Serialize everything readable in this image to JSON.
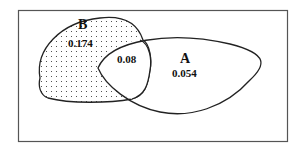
{
  "diagram": {
    "type": "venn",
    "sets": [
      {
        "id": "B",
        "label": "B",
        "value": "0.174",
        "fill": "dotted"
      },
      {
        "id": "A",
        "label": "A",
        "value": "0.054",
        "fill": "none"
      }
    ],
    "intersection": {
      "sets": [
        "A",
        "B"
      ],
      "value": "0.08"
    },
    "colors": {
      "stroke": "#222222",
      "background": "#ffffff",
      "dots": "#333333"
    }
  }
}
